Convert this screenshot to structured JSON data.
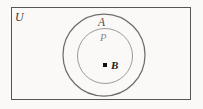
{
  "figure": {
    "type": "set-diagram",
    "caption_labels": {
      "universe": "U",
      "outer_set": "A",
      "inner_set": "P",
      "point": "B"
    },
    "background_color": "#faf9f7",
    "stroke_colors": {
      "rectangle": "#565656",
      "outer_circle": "#6e6e6e",
      "inner_circle": "#9a9a9a",
      "point_marker": "#111111"
    },
    "geometry": {
      "canvas": {
        "width": 203,
        "height": 109
      },
      "rectangle": {
        "x": 11,
        "y": 7,
        "width": 180,
        "height": 93
      },
      "outer_circle": {
        "cx": 104,
        "cy": 55,
        "r": 41
      },
      "inner_circle": {
        "cx": 105,
        "cy": 56,
        "r": 27.5
      },
      "point": {
        "x": 105,
        "y": 65,
        "size": 4
      }
    }
  }
}
